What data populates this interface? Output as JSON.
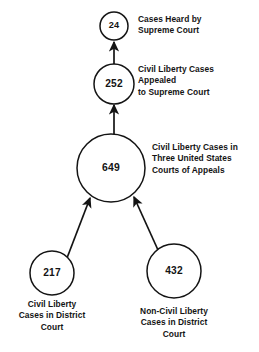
{
  "diagram": {
    "type": "flowchart",
    "title": "",
    "orientation": "bottom-up",
    "stroke_color": "#141414",
    "background_color": "#ffffff",
    "nodes": [
      {
        "id": "supreme-court-heard",
        "value": "24",
        "label": "Cases Heard by\nSupreme Court",
        "label_align": "left",
        "cx": 114,
        "cy": 26,
        "r": 14,
        "label_x": 138,
        "label_y": 14,
        "value_class": "v-small"
      },
      {
        "id": "appealed-supreme-court",
        "value": "252",
        "label": "Civil Liberty Cases\nAppealed\nto Supreme Court",
        "label_align": "left",
        "cx": 114,
        "cy": 84,
        "r": 20,
        "label_x": 138,
        "label_y": 64,
        "value_class": "v-medium"
      },
      {
        "id": "courts-of-appeals",
        "value": "649",
        "label": "Civil Liberty Cases in\nThree United States\nCourts of Appeals",
        "label_align": "left",
        "cx": 111,
        "cy": 168,
        "r": 34,
        "label_x": 152,
        "label_y": 142,
        "value_class": "v-large"
      },
      {
        "id": "district-court-civil-liberty",
        "value": "217",
        "label": "Civil Liberty\nCases in District\nCourt",
        "label_align": "center",
        "cx": 52,
        "cy": 273,
        "r": 22,
        "label_x": 52,
        "label_y": 299,
        "value_class": "v-medium"
      },
      {
        "id": "district-court-non-civil-liberty",
        "value": "432",
        "label": "Non-Civil Liberty\nCases in District\nCourt",
        "label_align": "center",
        "cx": 174,
        "cy": 271,
        "r": 27,
        "label_x": 174,
        "label_y": 306,
        "value_class": "v-medium"
      }
    ],
    "arrows": [
      {
        "id": "arrow-appealed-to-heard",
        "from": "appealed-supreme-court",
        "to": "supreme-court-heard",
        "x1": 114,
        "y1": 64,
        "x2": 114,
        "y2": 42
      },
      {
        "id": "arrow-appeals-to-appealed",
        "from": "courts-of-appeals",
        "to": "appealed-supreme-court",
        "x1": 114,
        "y1": 134,
        "x2": 114,
        "y2": 105
      },
      {
        "id": "arrow-district-civil-to-appeals",
        "from": "district-court-civil-liberty",
        "to": "courts-of-appeals",
        "x1": 67,
        "y1": 258,
        "x2": 90,
        "y2": 198
      },
      {
        "id": "arrow-district-noncivil-to-appeals",
        "from": "district-court-non-civil-liberty",
        "to": "courts-of-appeals",
        "x1": 158,
        "y1": 250,
        "x2": 134,
        "y2": 197
      }
    ]
  }
}
